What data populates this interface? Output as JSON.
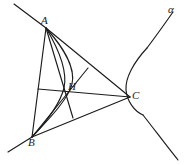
{
  "figure": {
    "type": "geometry-diagram",
    "stroke_color": "#1b1b1b",
    "background_color": "#ffffff",
    "width": 192,
    "height": 165,
    "labels": {
      "a": "A",
      "b": "B",
      "c": "C",
      "h": "H",
      "alpha": "α"
    },
    "label_positions": {
      "a": {
        "x": 41,
        "y": 15
      },
      "b": {
        "x": 28,
        "y": 137
      },
      "c": {
        "x": 132,
        "y": 90
      },
      "h": {
        "x": 68,
        "y": 81
      },
      "alpha": {
        "x": 168,
        "y": 4
      }
    },
    "points": {
      "A": {
        "x": 46,
        "y": 28
      },
      "B": {
        "x": 32,
        "y": 137
      },
      "C": {
        "x": 130,
        "y": 97
      },
      "H": {
        "x": 63,
        "y": 95
      },
      "foot_on_AB": {
        "x": 38,
        "y": 89
      },
      "foot_on_AC": {
        "x": 88,
        "y": 68
      },
      "foot_on_BC": {
        "x": 73,
        "y": 118
      }
    },
    "segments": [
      {
        "name": "side-AB",
        "from": "A",
        "to": "B"
      },
      {
        "name": "side-BC",
        "from": "B",
        "to": "C"
      },
      {
        "name": "side-CA",
        "from": "C",
        "to": "A"
      },
      {
        "name": "altitude-from-A",
        "from": "A",
        "to": "foot_on_BC"
      },
      {
        "name": "altitude-from-B",
        "from": "B",
        "to": "foot_on_AC"
      },
      {
        "name": "altitude-from-C",
        "from": "C",
        "to": "foot_on_AB"
      },
      {
        "name": "cevian-foot-AB-to-H",
        "from": "foot_on_AB",
        "to": "H"
      },
      {
        "name": "cevian-foot-AC-to-H",
        "from": "foot_on_AC",
        "to": "H"
      },
      {
        "name": "cevian-foot-BC-to-H",
        "from": "foot_on_BC",
        "to": "H"
      }
    ],
    "curve": {
      "name": "hyperbola-alpha",
      "branches": [
        "left-branch-through-A-H-B",
        "right-branch-through-C"
      ],
      "asymptote_rays": [
        "upper-left-ray",
        "lower-left-ray",
        "upper-right-ray",
        "lower-right-ray"
      ]
    }
  }
}
